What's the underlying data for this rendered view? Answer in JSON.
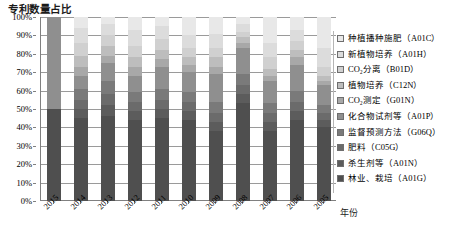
{
  "chart_data": {
    "type": "bar",
    "subtype": "stacked-percentage-column",
    "title": "专利数量占比",
    "xlabel": "年份",
    "ylabel": "",
    "ylim": [
      0,
      100
    ],
    "yunit": "%",
    "grid": true,
    "legend_position": "right",
    "categories": [
      "2015",
      "2014",
      "2013",
      "2012",
      "2011",
      "2010",
      "2009",
      "2008",
      "2007",
      "2006",
      "2005"
    ],
    "ytick_labels": [
      "100%",
      "90%",
      "80%",
      "70%",
      "60%",
      "50%",
      "40%",
      "30%",
      "20%",
      "10%",
      "0%"
    ],
    "ytick_values": [
      100,
      90,
      80,
      70,
      60,
      50,
      40,
      30,
      20,
      10,
      0
    ],
    "series": [
      {
        "name": "种植播种施肥（A01C）",
        "code": "A01C",
        "color": "#e8e8e8",
        "values": [
          0,
          6,
          4,
          7,
          5,
          10,
          9,
          4,
          14,
          7,
          17
        ]
      },
      {
        "name": "新植物培养（A01H）",
        "code": "A01H",
        "color": "#dcdcdc",
        "values": [
          0,
          8,
          6,
          9,
          7,
          7,
          8,
          4,
          8,
          6,
          10
        ]
      },
      {
        "name": "CO2 分离（B01D）",
        "code": "B01D",
        "color": "#d0d0d0",
        "values": [
          0,
          7,
          6,
          6,
          6,
          5,
          5,
          3,
          6,
          5,
          5
        ]
      },
      {
        "name": "植物培养（C12N）",
        "code": "C12N",
        "color": "#bdbdbd",
        "values": [
          0,
          6,
          5,
          5,
          5,
          4,
          5,
          3,
          4,
          4,
          3
        ]
      },
      {
        "name": "CO2 测定（G01N）",
        "code": "G01N",
        "color": "#a8a8a8",
        "values": [
          0,
          5,
          4,
          5,
          4,
          4,
          4,
          3,
          3,
          4,
          2
        ]
      },
      {
        "name": "化合物试剂等（A01P）",
        "code": "A01P",
        "color": "#8f8f8f",
        "values": [
          50,
          7,
          10,
          9,
          12,
          11,
          15,
          14,
          12,
          14,
          11
        ]
      },
      {
        "name": "监督预测方法（G06Q）",
        "code": "G06Q",
        "color": "#7a7a7a",
        "values": [
          0,
          6,
          7,
          5,
          6,
          5,
          6,
          6,
          5,
          6,
          4
        ]
      },
      {
        "name": "肥料（C05G）",
        "code": "C05G",
        "color": "#6b6b6b",
        "values": [
          0,
          5,
          6,
          5,
          5,
          5,
          5,
          5,
          5,
          5,
          4
        ]
      },
      {
        "name": "杀生剂等（A01N）",
        "code": "A01N",
        "color": "#5c5c5c",
        "values": [
          0,
          5,
          6,
          5,
          5,
          5,
          5,
          5,
          5,
          5,
          4
        ]
      },
      {
        "name": "林业、栽培（A01G）",
        "code": "A01G",
        "color": "#4f4f4f",
        "values": [
          50,
          45,
          46,
          44,
          45,
          44,
          38,
          53,
          38,
          44,
          40
        ]
      }
    ]
  },
  "legend": {
    "items": [
      {
        "label": "种植播种施肥（A01C）",
        "swatch": "#e8e8e8"
      },
      {
        "label": "新植物培养（A01H）",
        "swatch": "#dcdcdc"
      },
      {
        "label": "CO₂分离（B01D）",
        "swatch": "#d0d0d0"
      },
      {
        "label": "植物培养（C12N）",
        "swatch": "#bdbdbd"
      },
      {
        "label": "CO₂测定（G01N）",
        "swatch": "#a8a8a8"
      },
      {
        "label": "化合物试剂等（A01P）",
        "swatch": "#8f8f8f"
      },
      {
        "label": "监督预测方法（G06Q）",
        "swatch": "#7a7a7a"
      },
      {
        "label": "肥料（C05G）",
        "swatch": "#6b6b6b"
      },
      {
        "label": "杀生剂等（A01N）",
        "swatch": "#5c5c5c"
      },
      {
        "label": "林业、栽培（A01G）",
        "swatch": "#4f4f4f"
      }
    ]
  }
}
